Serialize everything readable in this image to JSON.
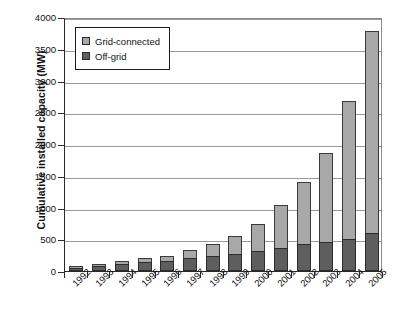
{
  "chart_data": {
    "type": "bar",
    "subtype": "stacked-vertical",
    "title": "",
    "xlabel": "",
    "ylabel": "Cumulative installed capacity (MW)",
    "ylim": [
      0,
      4000
    ],
    "ytick_step": 500,
    "ytick_labels": [
      "4000",
      "3500",
      "3000",
      "2500",
      "2000",
      "1500",
      "1000",
      "500",
      "0"
    ],
    "ytick_values": [
      4000,
      3500,
      3000,
      2500,
      2000,
      1500,
      1000,
      500,
      0
    ],
    "grid": true,
    "legend_position": "top-left-inside",
    "categories": [
      "1992",
      "1993",
      "1994",
      "1995",
      "1996",
      "1997",
      "1998",
      "1999",
      "2000",
      "2001",
      "2002",
      "2003",
      "2004",
      "2005"
    ],
    "series": [
      {
        "name": "Off-grid",
        "color": "#5e5e5e",
        "values": [
          55,
          85,
          110,
          140,
          165,
          200,
          235,
          270,
          310,
          365,
          420,
          460,
          510,
          600
        ]
      },
      {
        "name": "Grid-connected",
        "color": "#a8a8a8",
        "values": [
          20,
          30,
          55,
          65,
          70,
          130,
          195,
          275,
          430,
          670,
          975,
          1400,
          2170,
          3180
        ]
      }
    ],
    "totals": [
      75,
      115,
      165,
      205,
      235,
      330,
      430,
      545,
      740,
      1035,
      1395,
      1860,
      2680,
      3780
    ]
  },
  "legend": {
    "items": [
      {
        "label": "Grid-connected",
        "swatch": "light-gray-swatch-icon"
      },
      {
        "label": "Off-grid",
        "swatch": "dark-gray-swatch-icon"
      }
    ]
  },
  "axes": {
    "y_title": "Cumulative installed capacity (MW)"
  }
}
